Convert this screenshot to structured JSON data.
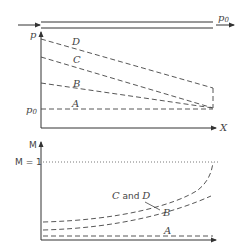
{
  "figure": {
    "flow": {
      "outlet_label": "p",
      "outlet_subscript": "0"
    },
    "pressure_plot": {
      "y_axis_label": "p",
      "x_axis_label": "X",
      "reference_label": "p",
      "reference_subscript": "0",
      "curves": [
        {
          "id": "D",
          "label": "D"
        },
        {
          "id": "C",
          "label": "C"
        },
        {
          "id": "B",
          "label": "B"
        },
        {
          "id": "A",
          "label": "A"
        }
      ]
    },
    "mach_plot": {
      "y_axis_label": "M",
      "reference_label": "M = 1",
      "curves": [
        {
          "id": "CD",
          "label_c": "C",
          "label_and": " and ",
          "label_d": "D"
        },
        {
          "id": "B",
          "label": "B"
        },
        {
          "id": "A",
          "label": "A"
        }
      ]
    }
  }
}
